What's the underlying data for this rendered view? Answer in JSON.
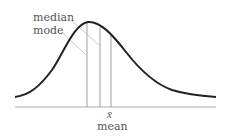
{
  "diagram": {
    "title": "",
    "labels": {
      "median": "median",
      "mode": "mode",
      "mean_symbol": "x̄",
      "mean": "mean"
    },
    "curve": {
      "type": "right-skewed distribution",
      "color": "#222222"
    },
    "markers": [
      {
        "name": "mode",
        "x": 87
      },
      {
        "name": "median",
        "x": 100
      },
      {
        "name": "mean",
        "x": 111
      }
    ],
    "colors": {
      "curve": "#222222",
      "baseline": "#aaaaaa",
      "markers": "#888888",
      "leaders": "#bbbbbb",
      "text": "#555555"
    }
  }
}
